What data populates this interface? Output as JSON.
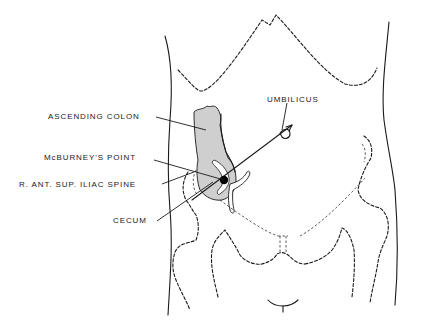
{
  "diagram": {
    "type": "anatomical-illustration",
    "labels": {
      "ascending_colon": "ASCENDING COLON",
      "mcburneys_point": "McBURNEY'S POINT",
      "iliac_spine": "R. ANT. SUP. ILIAC SPINE",
      "cecum": "CECUM",
      "umbilicus": "UMBILICUS"
    },
    "colors": {
      "line": "#1a1a1a",
      "colon_fill": "#cfcfcf",
      "background": "#ffffff",
      "point": "#000000"
    }
  }
}
